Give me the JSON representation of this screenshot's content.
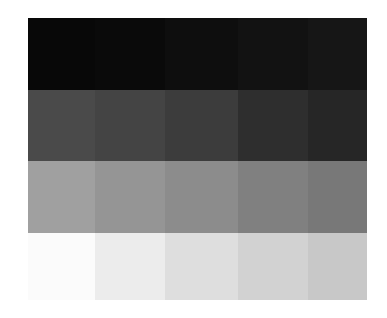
{
  "figure": {
    "rows": [
      {
        "label": "",
        "colors": [
          "#080808",
          "#0a0a0a",
          "#0e0e0e",
          "#121212",
          "#161616"
        ]
      },
      {
        "label": "",
        "colors": [
          "#4a4a4a",
          "#444444",
          "#3c3c3c",
          "#2e2e2e",
          "#262626"
        ]
      },
      {
        "label": "",
        "colors": [
          "#a0a0a0",
          "#959595",
          "#8c8c8c",
          "#808080",
          "#787878"
        ]
      },
      {
        "label": "",
        "colors": [
          "#fbfbfb",
          "#ececec",
          "#dedede",
          "#d2d2d2",
          "#c8c8c8"
        ]
      }
    ]
  }
}
